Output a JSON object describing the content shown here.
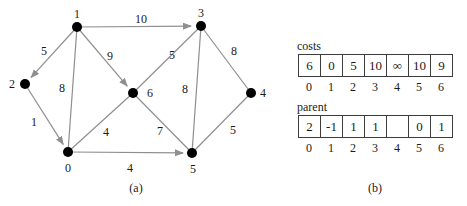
{
  "graph": {
    "node_labels": {
      "n0": "0",
      "n1": "1",
      "n2": "2",
      "n3": "3",
      "n4": "4",
      "n5": "5",
      "n6": "6"
    },
    "edge_weights": {
      "e1_2": "5",
      "e1_3": "10",
      "e1_6": "9",
      "e1_0": "8",
      "e6_3": "5",
      "e3_4": "8",
      "e2_0": "1",
      "e0_6": "4",
      "e6_5": "7",
      "e3_5": "8",
      "e0_5": "4",
      "e4_5": "5"
    }
  },
  "tables": {
    "costs": {
      "label": "costs",
      "values": [
        "6",
        "0",
        "5",
        "10",
        "∞",
        "10",
        "9"
      ],
      "indices": [
        "0",
        "1",
        "2",
        "3",
        "4",
        "5",
        "6"
      ]
    },
    "parent": {
      "label": "parent",
      "values": [
        "2",
        "-1",
        "1",
        "1",
        "",
        "0",
        "1"
      ],
      "indices": [
        "0",
        "1",
        "2",
        "3",
        "4",
        "5",
        "6"
      ]
    }
  },
  "captions": {
    "a": "(a)",
    "b": "(b)"
  }
}
